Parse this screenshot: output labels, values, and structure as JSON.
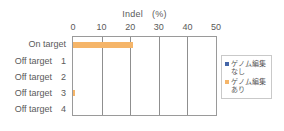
{
  "chart_data": {
    "type": "bar",
    "orientation": "horizontal",
    "title": "Indel　(%)",
    "xlabel": "",
    "ylabel": "",
    "categories": [
      "On target",
      "Off target　1",
      "Off target　2",
      "Off target　3",
      "Off target　4"
    ],
    "series": [
      {
        "name": "ゲノム編集なし",
        "color": "#4566a8",
        "values": [
          0,
          0,
          0,
          0,
          0
        ]
      },
      {
        "name": "ゲノム編集あり",
        "color": "#f5b569",
        "values": [
          21,
          0,
          0,
          0.6,
          0
        ]
      }
    ],
    "xlim": [
      0,
      50
    ],
    "xticks": [
      0,
      10,
      20,
      30,
      40,
      50
    ],
    "xtick_labels": [
      "0",
      "10",
      "20",
      "30",
      "40",
      "50"
    ],
    "grid": "vertical",
    "axis_position": "top",
    "legend_position": "right",
    "legend": [
      {
        "label_line1": "ゲノム編集",
        "label_line2": "なし",
        "color": "#4566a8"
      },
      {
        "label_line1": "ゲノム編集",
        "label_line2": "あり",
        "color": "#f5b569"
      }
    ],
    "colors": {
      "axis": "#9a9a9a",
      "grid": "#8f8f8f",
      "text": "#5a5a5a",
      "background": "#ffffff",
      "series_no_edit": "#4566a8",
      "series_edit": "#f5b569"
    }
  }
}
